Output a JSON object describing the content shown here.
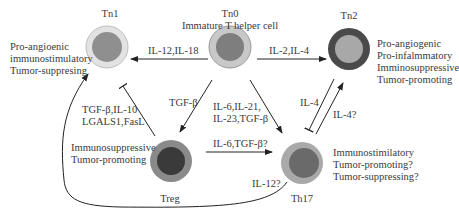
{
  "cells": {
    "tn0": {
      "name": "Tn0",
      "subtitle": "Immature T helper cell"
    },
    "tn1": {
      "name": "Tn1",
      "traits": [
        "Pro-angioenic",
        "immunostimulatory",
        "Tumor-suppresing"
      ]
    },
    "tn2": {
      "name": "Tn2",
      "traits": [
        "Pro-angiogenic",
        "Pro-infalmmatory",
        "Imminosuppressive",
        "Tumor-promoting"
      ]
    },
    "treg": {
      "name": "Treg",
      "traits": [
        "Immunosuppressive",
        "Tumor-promoting"
      ]
    },
    "th17": {
      "name": "Th17",
      "traits": [
        "Immunostimilatory",
        "Tumor-promoting?",
        "Tumor-suppressing?"
      ]
    }
  },
  "edges": {
    "tn0_tn1": "IL-12,IL-18",
    "tn0_tn2": "IL-2,IL-4",
    "tn0_treg": "TGF-β",
    "tn0_th17": [
      "IL-6,IL-21,",
      "IL-23,TGF-β"
    ],
    "treg_tn1": [
      "TGF-β,IL-10",
      "LGALS1,FasL"
    ],
    "treg_th17": "IL-6,TGF-β?",
    "th17_tn2_inhibit": "IL-4",
    "th17_tn2": "IL-4?",
    "th17_tn1": "IL-12?"
  },
  "colors": {
    "light_ring": "#d2d2d2",
    "mid_ring": "#9a9a9a",
    "dark_ring": "#555555",
    "inner_mid": "#8c8c8c",
    "inner_dark": "#3e3e3e",
    "line": "#222222"
  }
}
